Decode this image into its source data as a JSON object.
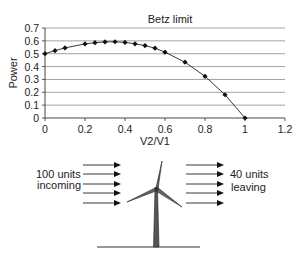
{
  "chart_data": {
    "type": "line",
    "title": "Betz limit",
    "xlabel": "V2/V1",
    "ylabel": "Power",
    "xlim": [
      0,
      1.2
    ],
    "ylim": [
      0,
      0.7
    ],
    "x_ticks": [
      "0",
      "0.2",
      "0.4",
      "0.6",
      "0.8",
      "1",
      "1.2"
    ],
    "y_ticks": [
      "0",
      "0.1",
      "0.2",
      "0.3",
      "0.4",
      "0.5",
      "0.6",
      "0.7"
    ],
    "grid": "horizontal",
    "legend": "none",
    "series": [
      {
        "name": "Power",
        "x": [
          0,
          0.05,
          0.1,
          0.2,
          0.25,
          0.3,
          0.35,
          0.4,
          0.45,
          0.5,
          0.55,
          0.6,
          0.7,
          0.8,
          0.9,
          1.0
        ],
        "values": [
          0.5,
          0.524,
          0.545,
          0.576,
          0.586,
          0.592,
          0.593,
          0.588,
          0.577,
          0.563,
          0.543,
          0.512,
          0.434,
          0.324,
          0.181,
          0.0
        ]
      }
    ]
  },
  "diagram": {
    "incoming_label_line1": "100 units",
    "incoming_label_line2": "incoming",
    "leaving_label_line1": "40 units",
    "leaving_label_line2": "leaving",
    "incoming_arrow_count": 5,
    "leaving_arrow_count": 5
  }
}
